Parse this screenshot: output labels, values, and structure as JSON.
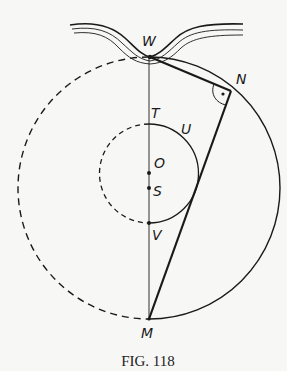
{
  "figure": {
    "caption": "Fig. 118",
    "caption_display": "FIG. 118"
  },
  "labels": {
    "W": "W",
    "N": "N",
    "T": "T",
    "U": "U",
    "O": "O",
    "S": "S",
    "V": "V",
    "M": "M"
  },
  "elements": {
    "outer_circle": {
      "center": [
        149,
        188
      ],
      "radius": 131,
      "left_half": "dashed",
      "right_half": "solid"
    },
    "inner_circle": {
      "center": [
        149,
        157
      ],
      "radius": 31,
      "left_half": "dashed",
      "right_half": "solid"
    },
    "vertical_line": {
      "from": "W",
      "to": "M"
    },
    "chord_WN": {
      "from": "W",
      "to": "N",
      "style": "thick"
    },
    "chord_NM": {
      "from": "N",
      "to": "M",
      "style": "thick"
    },
    "right_angle_marker": {
      "at": "N"
    },
    "surface_bands": "wavy double lines across the top through W"
  },
  "colors": {
    "ink": "#1a1a1a",
    "background": "#f7f7f5"
  }
}
